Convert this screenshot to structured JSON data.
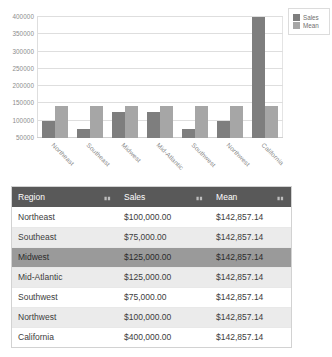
{
  "chart_data": {
    "type": "bar",
    "title": "",
    "xlabel": "",
    "ylabel": "",
    "grid": true,
    "legend_position": "right",
    "ylim": [
      50000,
      400000
    ],
    "yticks": [
      400000,
      350000,
      300000,
      250000,
      200000,
      150000,
      100000,
      50000
    ],
    "ytick_labels": [
      "400000",
      "350000",
      "300000",
      "250000",
      "200000",
      "150000",
      "100000",
      "50000"
    ],
    "categories": [
      "Northeast",
      "Southeast",
      "Midwest",
      "Mid-Atlantic",
      "Southwest",
      "Northwest",
      "California"
    ],
    "series": [
      {
        "name": "Sales",
        "color": "#7e7e7e",
        "values": [
          100000,
          75000,
          125000,
          125000,
          75000,
          100000,
          400000
        ]
      },
      {
        "name": "Mean",
        "color": "#a6a6a6",
        "values": [
          142857.14,
          142857.14,
          142857.14,
          142857.14,
          142857.14,
          142857.14,
          142857.14
        ]
      }
    ]
  },
  "legend": {
    "items": [
      {
        "label": "Sales",
        "color": "#7e7e7e"
      },
      {
        "label": "Mean",
        "color": "#a6a6a6"
      }
    ]
  },
  "table": {
    "columns": [
      {
        "label": "Region",
        "sort_icon": "sort-arrows-icon"
      },
      {
        "label": "Sales",
        "sort_icon": "sort-arrows-icon"
      },
      {
        "label": "Mean",
        "sort_icon": "sort-arrows-icon"
      }
    ],
    "rows": [
      {
        "region": "Northeast",
        "sales": "$100,000.00",
        "mean": "$142,857.14",
        "selected": false
      },
      {
        "region": "Southeast",
        "sales": "$75,000.00",
        "mean": "$142,857.14",
        "selected": false
      },
      {
        "region": "Midwest",
        "sales": "$125,000.00",
        "mean": "$142,857.14",
        "selected": true
      },
      {
        "region": "Mid-Atlantic",
        "sales": "$125,000.00",
        "mean": "$142,857.14",
        "selected": false
      },
      {
        "region": "Southwest",
        "sales": "$75,000.00",
        "mean": "$142,857.14",
        "selected": false
      },
      {
        "region": "Northwest",
        "sales": "$100,000.00",
        "mean": "$142,857.14",
        "selected": false
      },
      {
        "region": "California",
        "sales": "$400,000.00",
        "mean": "$142,857.14",
        "selected": false
      }
    ]
  },
  "colors": {
    "series_sales": "#7e7e7e",
    "series_mean": "#a6a6a6",
    "table_header_bg": "#595959",
    "table_selected_bg": "#9a9a9a",
    "table_stripe_bg": "#ebebeb"
  }
}
